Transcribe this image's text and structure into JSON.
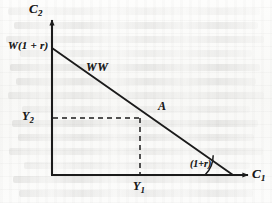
{
  "figure": {
    "axes": {
      "y_axis_label": "C",
      "y_axis_subscript": "2",
      "x_axis_label": "C",
      "x_axis_subscript": "1"
    },
    "labels": {
      "vertical_intercept": "W(1 + r)",
      "budget_line": "WW",
      "endowment_point": "A",
      "income_period2": "Y",
      "income_period2_subscript": "2",
      "income_period1": "Y",
      "income_period1_subscript": "1",
      "slope_angle": "(1+r)"
    },
    "colors": {
      "ink": "#1b1b1b",
      "paper": "#fbfbfa",
      "bleed": "#69676 4"
    }
  },
  "chart_data": {
    "type": "line",
    "xlabel": "C1",
    "ylabel": "C2",
    "grid": false,
    "legend": "none",
    "xlim": [
      0,
      1
    ],
    "ylim": [
      0,
      1
    ],
    "series": [
      {
        "name": "WW",
        "type": "line",
        "comment": "Budget line from vertical intercept W(1+r) to horizontal intercept; slope magnitude (1+r)",
        "x": [
          0.0,
          1.0
        ],
        "y": [
          1.0,
          0.0
        ],
        "annotation": "WW"
      }
    ],
    "points": [
      {
        "name": "A",
        "label": "A",
        "x": 0.489,
        "y": 0.449,
        "comment": "Endowment point on the budget line",
        "x_tick_label": "Y1",
        "y_tick_label": "Y2",
        "dashed_projection": true
      }
    ],
    "annotations": [
      {
        "name": "vertical-intercept",
        "text": "W(1 + r)",
        "x": 0.0,
        "y": 1.0
      },
      {
        "name": "budget-line-name",
        "text": "WW",
        "x": 0.22,
        "y": 0.82
      },
      {
        "name": "slope-angle",
        "text": "(1+r)",
        "x": 0.78,
        "y": 0.06
      }
    ],
    "axis_ticks": {
      "x": [
        {
          "label": "Y1",
          "value": 0.489
        }
      ],
      "y": [
        {
          "label": "Y2",
          "value": 0.449
        }
      ]
    }
  },
  "bleed_lines": [
    {
      "left": 8,
      "top": 8,
      "width": 252
    },
    {
      "left": 14,
      "top": 22,
      "width": 244
    },
    {
      "left": 6,
      "top": 36,
      "width": 258
    },
    {
      "left": 20,
      "top": 50,
      "width": 232
    },
    {
      "left": 10,
      "top": 64,
      "width": 250
    },
    {
      "left": 16,
      "top": 78,
      "width": 240
    },
    {
      "left": 8,
      "top": 92,
      "width": 256
    },
    {
      "left": 22,
      "top": 106,
      "width": 228
    },
    {
      "left": 12,
      "top": 120,
      "width": 246
    },
    {
      "left": 18,
      "top": 134,
      "width": 236
    },
    {
      "left": 9,
      "top": 148,
      "width": 254
    },
    {
      "left": 24,
      "top": 162,
      "width": 226
    },
    {
      "left": 13,
      "top": 176,
      "width": 242
    },
    {
      "left": 19,
      "top": 190,
      "width": 234
    }
  ]
}
